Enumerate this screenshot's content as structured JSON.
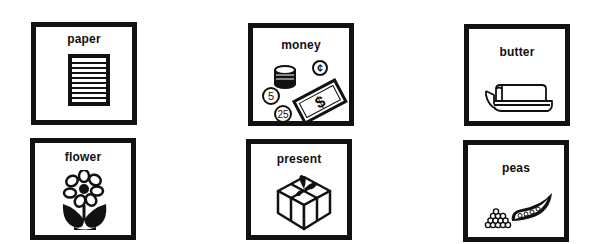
{
  "cards": [
    {
      "id": "paper",
      "label": "paper",
      "icon": "paper-icon"
    },
    {
      "id": "money",
      "label": "money",
      "icon": "money-icon",
      "coin_labels": [
        "¢",
        "5",
        "25"
      ],
      "bill_symbol": "$"
    },
    {
      "id": "butter",
      "label": "butter",
      "icon": "butter-dish-icon"
    },
    {
      "id": "flower",
      "label": "flower",
      "icon": "flower-icon"
    },
    {
      "id": "present",
      "label": "present",
      "icon": "gift-box-icon"
    },
    {
      "id": "peas",
      "label": "peas",
      "icon": "pea-pod-icon"
    }
  ],
  "colors": {
    "ink": "#111111",
    "background": "#ffffff"
  }
}
